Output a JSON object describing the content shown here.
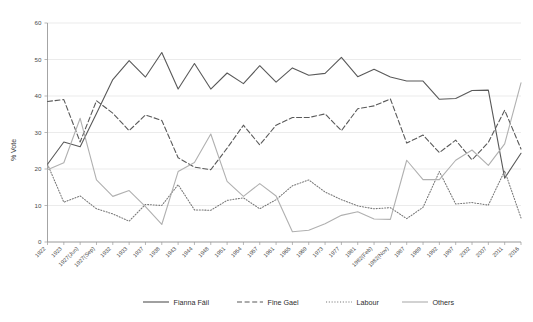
{
  "chart_data": {
    "type": "line",
    "title": "",
    "subtitle": "",
    "xlabel": "",
    "ylabel": "% Vote",
    "ylim": [
      0,
      60
    ],
    "yticks": [
      0,
      10,
      20,
      30,
      40,
      50,
      60
    ],
    "grid": true,
    "legend_position": "bottom",
    "categories": [
      "1922",
      "1923",
      "1927(Jun)",
      "1927(Sep)",
      "1932",
      "1933",
      "1937",
      "1938",
      "1943",
      "1944",
      "1948",
      "1951",
      "1954",
      "1957",
      "1961",
      "1965",
      "1969",
      "1973",
      "1977",
      "1981",
      "1982(Feb)",
      "1982(Nov)",
      "1987",
      "1989",
      "1992",
      "1997",
      "2002",
      "2007",
      "2011",
      "2016"
    ],
    "series": [
      {
        "name": "Fianna Fáil",
        "color": "#595959",
        "dash": "none",
        "values": [
          21.3,
          27.4,
          26.1,
          35.2,
          44.5,
          49.7,
          45.2,
          51.9,
          41.9,
          48.9,
          41.9,
          46.3,
          43.4,
          48.3,
          43.8,
          47.7,
          45.7,
          46.2,
          50.6,
          45.3,
          47.3,
          45.2,
          44.1,
          44.1,
          39.1,
          39.3,
          41.5,
          41.6,
          17.5,
          24.3
        ]
      },
      {
        "name": "Fine Gael",
        "color": "#595959",
        "dash": "dashed",
        "values": [
          38.5,
          39.0,
          27.4,
          38.7,
          35.3,
          30.5,
          34.8,
          33.3,
          23.1,
          20.5,
          19.8,
          25.7,
          32.0,
          26.6,
          32.0,
          34.1,
          34.1,
          35.1,
          30.5,
          36.5,
          37.3,
          39.2,
          27.1,
          29.3,
          24.5,
          27.9,
          22.5,
          27.3,
          36.1,
          25.5
        ]
      },
      {
        "name": "Labour",
        "color": "#777777",
        "dash": "dotted",
        "values": [
          21.3,
          10.9,
          12.6,
          9.1,
          7.7,
          5.7,
          10.3,
          10.0,
          15.7,
          8.8,
          8.7,
          11.4,
          12.1,
          9.1,
          11.6,
          15.4,
          17.0,
          13.7,
          11.6,
          9.9,
          9.1,
          9.4,
          6.4,
          9.5,
          19.3,
          10.4,
          10.8,
          10.1,
          19.5,
          6.6
        ]
      },
      {
        "name": "Others",
        "color": "#b0b0b0",
        "dash": "none",
        "values": [
          19.8,
          21.7,
          33.9,
          17.0,
          12.5,
          14.1,
          9.7,
          4.8,
          19.3,
          21.8,
          29.6,
          16.6,
          12.5,
          16.0,
          12.6,
          2.8,
          3.2,
          5.0,
          7.3,
          8.3,
          6.3,
          6.2,
          22.4,
          17.1,
          17.1,
          22.4,
          25.2,
          21.0,
          26.9,
          43.6
        ]
      }
    ]
  },
  "legend": {
    "items": [
      {
        "label": "Fianna Fáil",
        "style": "solid-dark"
      },
      {
        "label": "Fine Gael",
        "style": "dashed-dark"
      },
      {
        "label": "Labour",
        "style": "dotted-gray"
      },
      {
        "label": "Others",
        "style": "solid-light"
      }
    ]
  },
  "axes": {
    "y_title": "% Vote",
    "y_tick_labels": [
      "0",
      "10",
      "20",
      "30",
      "40",
      "50",
      "60"
    ]
  },
  "colors": {
    "fianna_fail": "#595959",
    "fine_gael": "#595959",
    "labour": "#777777",
    "others": "#b0b0b0",
    "grid": "#e2e2e2",
    "axis": "#9a9a9a",
    "text": "#3a3a3a",
    "background": "#ffffff"
  }
}
